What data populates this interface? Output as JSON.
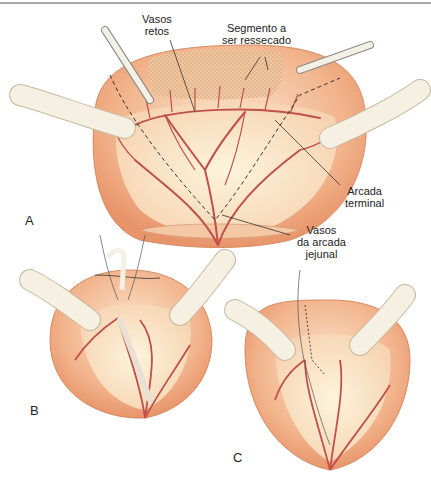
{
  "figure": {
    "panels": [
      {
        "id": "A",
        "label": "A"
      },
      {
        "id": "B",
        "label": "B"
      },
      {
        "id": "C",
        "label": "C"
      }
    ],
    "annotations": {
      "vasos_retos": {
        "line1": "Vasos",
        "line2": "retos"
      },
      "segmento": {
        "line1": "Segmento a",
        "line2": "ser ressecado"
      },
      "arcada_terminal": {
        "line1": "Arcada",
        "line2": "terminal"
      },
      "vasos_arcada": {
        "line1": "Vasos",
        "line2": "da arcada",
        "line3": "jejunal"
      }
    },
    "colors": {
      "tissue": "#f2b48c",
      "tissue_dark": "#e8946a",
      "mesentery": "#f8dcc0",
      "vessel": "#c0504a",
      "instrument": "#f4f0e4",
      "stipple": "#c98a60"
    }
  }
}
